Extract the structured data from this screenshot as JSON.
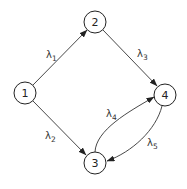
{
  "diagram": {
    "type": "directed-graph",
    "nodes": [
      {
        "id": "1",
        "label": "1",
        "cx": 25,
        "cy": 93,
        "r": 11
      },
      {
        "id": "2",
        "label": "2",
        "cx": 95,
        "cy": 22,
        "r": 11
      },
      {
        "id": "3",
        "label": "3",
        "cx": 95,
        "cy": 163,
        "r": 11
      },
      {
        "id": "4",
        "label": "4",
        "cx": 165,
        "cy": 95,
        "r": 11
      }
    ],
    "edges": [
      {
        "from": "1",
        "to": "2",
        "symbol": "λ",
        "subscript": "1"
      },
      {
        "from": "1",
        "to": "3",
        "symbol": "λ",
        "subscript": "2"
      },
      {
        "from": "2",
        "to": "4",
        "symbol": "λ",
        "subscript": "3"
      },
      {
        "from": "3",
        "to": "4",
        "symbol": "λ",
        "subscript": "4"
      },
      {
        "from": "4",
        "to": "3",
        "symbol": "λ",
        "subscript": "5"
      }
    ],
    "colors": {
      "stroke": "#333333",
      "background": "#ffffff"
    }
  }
}
